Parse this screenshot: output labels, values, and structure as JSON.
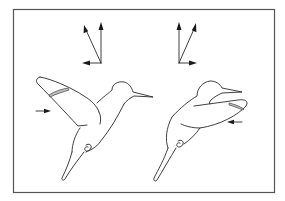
{
  "figure": {
    "description": "Two hummingbird line drawings in hovering flight with force vector diagrams above each",
    "colors": {
      "stroke": "#2a2a2a",
      "frame": "#555555",
      "hatch": "#bdbdbd",
      "background": "#ffffff"
    },
    "panels": [
      {
        "id": "left",
        "stroke_phase": "wing raised / upstroke-start",
        "vectors": [
          {
            "name": "vertical",
            "direction": "up"
          },
          {
            "name": "resultant",
            "direction": "up-left"
          },
          {
            "name": "horizontal",
            "direction": "left"
          }
        ],
        "side_arrow": {
          "direction": "right"
        }
      },
      {
        "id": "right",
        "stroke_phase": "wing forward / downstroke",
        "vectors": [
          {
            "name": "vertical",
            "direction": "up"
          },
          {
            "name": "resultant",
            "direction": "up-right"
          },
          {
            "name": "horizontal",
            "direction": "right"
          }
        ],
        "side_arrow": {
          "direction": "left"
        }
      }
    ]
  }
}
